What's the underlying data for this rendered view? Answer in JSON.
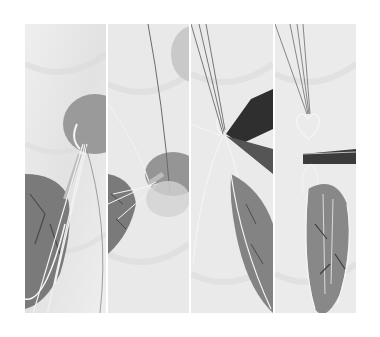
{
  "figure": {
    "palette": {
      "background": "#ffffff",
      "cloth": "#e9e9e9",
      "cloth_shadow": "#d6d6d6",
      "stone_dark": "#6e6e6e",
      "stone_mid": "#8c8c8c",
      "wire": "#f4f4f4",
      "pliers": "#3a3a3a"
    },
    "panels": [
      {
        "step": 1,
        "subject": "wire bundle wrapped beneath stone, stone lower-left"
      },
      {
        "step": 2,
        "subject": "wires spread with coil, stone at lower-left"
      },
      {
        "step": 3,
        "subject": "pliers forming loop above elongated stone"
      },
      {
        "step": 4,
        "subject": "heart-shaped bail formed with pliers above finished pendant"
      }
    ]
  }
}
